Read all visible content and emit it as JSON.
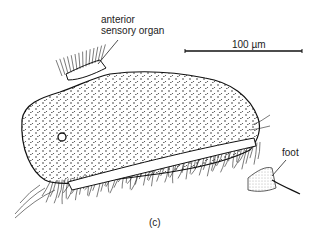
{
  "figure": {
    "panel_label": "(c)",
    "annotations": [
      {
        "id": "anterior-sensory-organ",
        "lines": [
          "anterior",
          "sensory organ"
        ]
      },
      {
        "id": "foot",
        "lines": [
          "foot"
        ]
      }
    ],
    "scale_bar": {
      "label": "100 µm",
      "value": 100,
      "unit": "µm"
    }
  }
}
